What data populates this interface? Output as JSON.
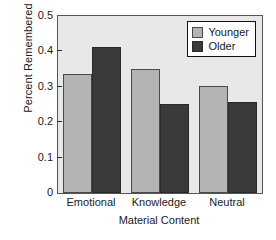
{
  "chart_data": {
    "type": "bar",
    "title": "",
    "xlabel": "Material Content",
    "ylabel": "Percent Remembered",
    "categories": [
      "Emotional",
      "Knowledge",
      "Neutral"
    ],
    "series": [
      {
        "name": "Younger",
        "values": [
          0.335,
          0.35,
          0.303
        ],
        "color": "#b3b3b3"
      },
      {
        "name": "Older",
        "values": [
          0.413,
          0.252,
          0.256
        ],
        "color": "#3a3a3a"
      }
    ],
    "ylim": [
      0,
      0.5
    ],
    "yticks": [
      "0",
      "0.1",
      "0.2",
      "0.3",
      "0.4",
      "0.5"
    ],
    "ytick_values": [
      0,
      0.1,
      0.2,
      0.3,
      0.4,
      0.5
    ],
    "grid": false,
    "legend_position": "top-right",
    "plot_background": "#e8e8e8",
    "figure_background": "#ffffff"
  }
}
